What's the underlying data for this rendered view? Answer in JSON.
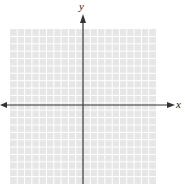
{
  "diagram": {
    "type": "coordinate-plane",
    "x_axis_label": "x",
    "y_axis_label": "y",
    "grid": {
      "cells_x": 20,
      "cells_y": 21,
      "background_color": "#e6e6e6",
      "line_color": "#ffffff"
    },
    "axis_color": "#333333",
    "tick_labels": "none"
  }
}
